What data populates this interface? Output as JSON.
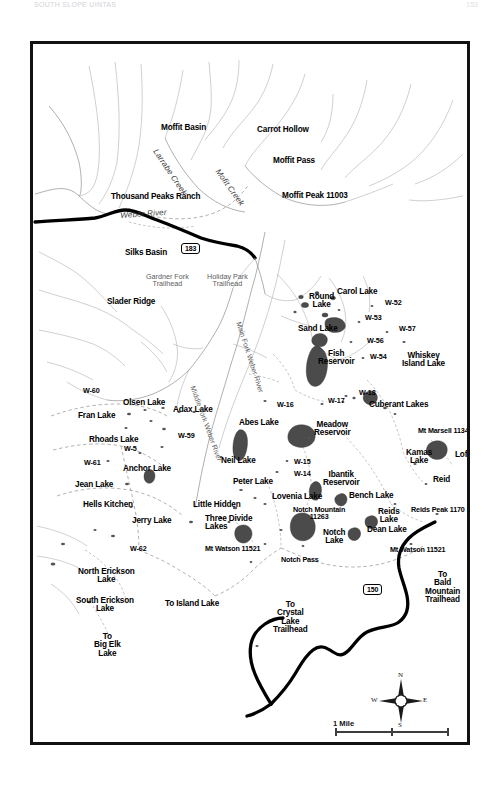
{
  "page": {
    "header_left": "SOUTH SLOPE UINTAS",
    "header_right": "153"
  },
  "map": {
    "title": "Uinta Mountains Lakes Map",
    "frame_color": "#121212",
    "background": "#ffffff",
    "highway_color": "#000000",
    "water_color": "#4a4a4a"
  },
  "highways": [
    {
      "id": "shield-183",
      "number": "183",
      "x": 148,
      "y": 199
    },
    {
      "id": "shield-150",
      "number": "150",
      "x": 330,
      "y": 540
    }
  ],
  "rivers": [
    {
      "name": "Weber River",
      "x": 87,
      "y": 168,
      "style": "italic-creek rot-web"
    },
    {
      "name": "Larrabe Creek",
      "x": 125,
      "y": 104,
      "style": "italic-creek rot-lar"
    },
    {
      "name": "Mofit Creek",
      "x": 187,
      "y": 124,
      "style": "italic-creek rot-mof"
    },
    {
      "name": "Middle Fork Weber River",
      "x": 163,
      "y": 341,
      "style": "thin rot-mfk"
    },
    {
      "name": "Main Fork Weber River",
      "x": 209,
      "y": 277,
      "style": "thin rot-fwr"
    }
  ],
  "trailheads": [
    {
      "name": "Gardner Fork\nTrailhead",
      "x": 113,
      "y": 229
    },
    {
      "name": "Holiday Park\nTrailhead",
      "x": 174,
      "y": 229
    }
  ],
  "places": [
    {
      "name": "Moffit Basin",
      "x": 128,
      "y": 80,
      "cls": "lk"
    },
    {
      "name": "Carrot Hollow",
      "x": 224,
      "y": 82,
      "cls": "lk"
    },
    {
      "name": "Moffit Pass",
      "x": 240,
      "y": 113,
      "cls": "lk"
    },
    {
      "name": "Moffit Peak 11003",
      "x": 249,
      "y": 148,
      "cls": "lk"
    },
    {
      "name": "Thousand Peaks Ranch",
      "x": 78,
      "y": 149,
      "cls": "lk"
    },
    {
      "name": "Silks Basin",
      "x": 92,
      "y": 205,
      "cls": "lk"
    },
    {
      "name": "Slader Ridge",
      "x": 74,
      "y": 254,
      "cls": "lk"
    },
    {
      "name": "Round\nLake",
      "x": 276,
      "y": 249,
      "cls": "lk ctr"
    },
    {
      "name": "Carol Lake",
      "x": 304,
      "y": 244,
      "cls": "lk"
    },
    {
      "name": "Sand Lake",
      "x": 265,
      "y": 281,
      "cls": "lk"
    },
    {
      "name": "Fish\nReservoir",
      "x": 285,
      "y": 306,
      "cls": "lk ctr"
    },
    {
      "name": "Whiskey\nIsland Lake",
      "x": 369,
      "y": 308,
      "cls": "lk ctr"
    },
    {
      "name": "Olsen Lake",
      "x": 90,
      "y": 355,
      "cls": "lk"
    },
    {
      "name": "Adax Lake",
      "x": 140,
      "y": 362,
      "cls": "lk"
    },
    {
      "name": "Fran Lake",
      "x": 45,
      "y": 368,
      "cls": "lk"
    },
    {
      "name": "Abes Lake",
      "x": 206,
      "y": 375,
      "cls": "lk"
    },
    {
      "name": "Rhoads Lake",
      "x": 56,
      "y": 392,
      "cls": "lk"
    },
    {
      "name": "Meadow\nReservoir",
      "x": 281,
      "y": 377,
      "cls": "lk ctr"
    },
    {
      "name": "Cuberant Lakes",
      "x": 336,
      "y": 357,
      "cls": "lk"
    },
    {
      "name": "Mt Marsell 11340",
      "x": 385,
      "y": 383,
      "cls": "lk sm"
    },
    {
      "name": "Kamas\nLake",
      "x": 373,
      "y": 405,
      "cls": "lk ctr"
    },
    {
      "name": "Lofty",
      "x": 422,
      "y": 407,
      "cls": "lk"
    },
    {
      "name": "Reid",
      "x": 400,
      "y": 432,
      "cls": "lk"
    },
    {
      "name": "Neil Lake",
      "x": 188,
      "y": 413,
      "cls": "lk"
    },
    {
      "name": "Anchor Lake",
      "x": 90,
      "y": 421,
      "cls": "lk"
    },
    {
      "name": "Jean Lake",
      "x": 42,
      "y": 437,
      "cls": "lk"
    },
    {
      "name": "Peter Lake",
      "x": 200,
      "y": 434,
      "cls": "lk"
    },
    {
      "name": "Ibantik\nReservoir",
      "x": 290,
      "y": 427,
      "cls": "lk ctr"
    },
    {
      "name": "Lovenia Lake",
      "x": 239,
      "y": 449,
      "cls": "lk"
    },
    {
      "name": "Hells Kitchen",
      "x": 50,
      "y": 457,
      "cls": "lk"
    },
    {
      "name": "Little Hidden",
      "x": 160,
      "y": 457,
      "cls": "lk"
    },
    {
      "name": "Bench Lake",
      "x": 316,
      "y": 448,
      "cls": "lk"
    },
    {
      "name": "Notch Mountain\n11263",
      "x": 260,
      "y": 462,
      "cls": "lk ctr sm"
    },
    {
      "name": "Reids\nLake",
      "x": 345,
      "y": 464,
      "cls": "lk ctr"
    },
    {
      "name": "Reids Peak 1170",
      "x": 378,
      "y": 462,
      "cls": "lk sm"
    },
    {
      "name": "Jerry Lake",
      "x": 99,
      "y": 473,
      "cls": "lk"
    },
    {
      "name": "Three Divide\nLakes",
      "x": 172,
      "y": 471,
      "cls": "lk"
    },
    {
      "name": "Dean Lake",
      "x": 334,
      "y": 482,
      "cls": "lk"
    },
    {
      "name": "Notch\nLake",
      "x": 290,
      "y": 485,
      "cls": "lk ctr"
    },
    {
      "name": "Mt Watson 11521",
      "x": 172,
      "y": 501,
      "cls": "lk sm"
    },
    {
      "name": "Mt Watson 11521",
      "x": 357,
      "y": 502,
      "cls": "lk sm"
    },
    {
      "name": "Notch Pass",
      "x": 248,
      "y": 512,
      "cls": "lk sm"
    },
    {
      "name": "North Erickson\nLake",
      "x": 45,
      "y": 524,
      "cls": "lk ctr"
    },
    {
      "name": "South Erickson\nLake",
      "x": 43,
      "y": 553,
      "cls": "lk ctr"
    },
    {
      "name": "To Island Lake",
      "x": 132,
      "y": 556,
      "cls": "lk"
    },
    {
      "name": "To\nCrystal\nLake\nTrailhead",
      "x": 240,
      "y": 557,
      "cls": "lk ctr"
    },
    {
      "name": "To\nBald\nMountain\nTrailhead",
      "x": 392,
      "y": 527,
      "cls": "lk ctr"
    },
    {
      "name": "To\nBig Elk\nLake",
      "x": 61,
      "y": 589,
      "cls": "lk ctr"
    }
  ],
  "waypoints": [
    {
      "code": "W-60",
      "x": 50,
      "y": 343
    },
    {
      "code": "W-16",
      "x": 244,
      "y": 357
    },
    {
      "code": "W-59",
      "x": 145,
      "y": 388
    },
    {
      "code": "W-5",
      "x": 91,
      "y": 401
    },
    {
      "code": "W-61",
      "x": 51,
      "y": 415
    },
    {
      "code": "W-52",
      "x": 352,
      "y": 255
    },
    {
      "code": "W-53",
      "x": 332,
      "y": 270
    },
    {
      "code": "W-57",
      "x": 366,
      "y": 281
    },
    {
      "code": "W-56",
      "x": 334,
      "y": 293
    },
    {
      "code": "W-54",
      "x": 337,
      "y": 309
    },
    {
      "code": "W-17",
      "x": 295,
      "y": 353
    },
    {
      "code": "W-18",
      "x": 326,
      "y": 345
    },
    {
      "code": "W-15",
      "x": 261,
      "y": 414
    },
    {
      "code": "W-14",
      "x": 261,
      "y": 426
    },
    {
      "code": "W-62",
      "x": 97,
      "y": 501
    }
  ],
  "compass": {
    "north": "N",
    "south": "S",
    "east": "E",
    "west": "W"
  },
  "scales": [
    {
      "label": "1 Mile",
      "x": 300,
      "y": 675,
      "bar_x": 302,
      "bar_y": 687,
      "bar_w": 112,
      "ticks": [
        0,
        56,
        112
      ]
    },
    {
      "label": "2 KM",
      "x": 300,
      "y": 700,
      "bar_x": 302,
      "bar_y": 713,
      "bar_w": 82,
      "ticks": [
        0,
        82
      ]
    }
  ]
}
